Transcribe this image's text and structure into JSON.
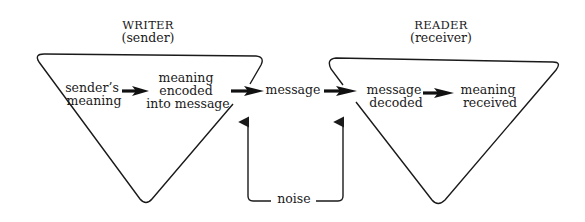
{
  "diagram": {
    "writer": {
      "title": "WRITER",
      "subtitle": "(sender)",
      "nodes": [
        [
          "sender’s",
          "meaning"
        ],
        [
          "meaning",
          "encoded",
          "into message"
        ]
      ]
    },
    "message": "message",
    "reader": {
      "title": "READER",
      "subtitle": "(receiver)",
      "nodes": [
        [
          "message",
          "decoded"
        ],
        [
          "meaning",
          "received"
        ]
      ]
    },
    "noise": "noise",
    "colors": {
      "ink": "#1a1a1a",
      "background": "#ffffff"
    }
  }
}
